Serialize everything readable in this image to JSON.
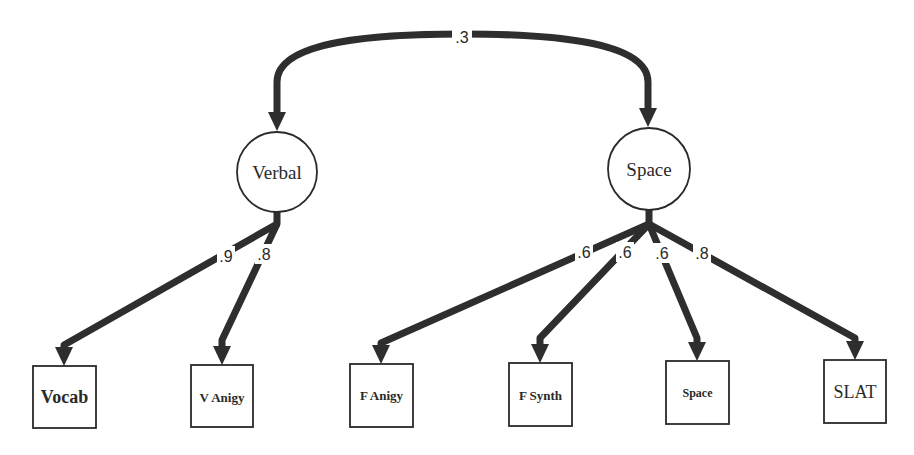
{
  "diagram": {
    "type": "structural-equation-model",
    "stroke_color": "#2e2e2e",
    "background": "#ffffff",
    "correlation": {
      "from": "Verbal",
      "to": "Space",
      "label": ".3",
      "label_pos": [
        462,
        36
      ]
    },
    "latents": [
      {
        "id": "verbal",
        "label": "Verbal",
        "cx": 277,
        "cy": 172,
        "r": 40
      },
      {
        "id": "space",
        "label": "Space",
        "cx": 649,
        "cy": 169,
        "r": 41
      }
    ],
    "observed": [
      {
        "id": "vocab",
        "label": "Vocab",
        "x": 33,
        "y": 366,
        "w": 63,
        "h": 62,
        "font_size": 18
      },
      {
        "id": "v-anigy",
        "label": "V Anigy",
        "x": 191,
        "y": 365,
        "w": 62,
        "h": 62,
        "font_size": 13
      },
      {
        "id": "f-anigy",
        "label": "F Anigy",
        "x": 350,
        "y": 364,
        "w": 63,
        "h": 63,
        "font_size": 13
      },
      {
        "id": "f-synth",
        "label": "F Synth",
        "x": 509,
        "y": 363,
        "w": 63,
        "h": 63,
        "font_size": 13
      },
      {
        "id": "space-test",
        "label": "Space",
        "x": 666,
        "y": 361,
        "w": 63,
        "h": 63,
        "font_size": 12
      },
      {
        "id": "slat",
        "label": "SLAT",
        "x": 824,
        "y": 360,
        "w": 62,
        "h": 63,
        "font_size": 18
      }
    ],
    "loadings": [
      {
        "from": "Verbal",
        "to": "Vocab",
        "label": ".9",
        "label_pos": [
          226,
          256
        ]
      },
      {
        "from": "Verbal",
        "to": "V Anigy",
        "label": ".8",
        "label_pos": [
          264,
          254
        ]
      },
      {
        "from": "Space",
        "to": "F Anigy",
        "label": ".6",
        "label_pos": [
          584,
          252
        ]
      },
      {
        "from": "Space",
        "to": "F Synth",
        "label": ".6",
        "label_pos": [
          625,
          252
        ]
      },
      {
        "from": "Space",
        "to": "Space",
        "label": ".6",
        "label_pos": [
          662,
          253
        ]
      },
      {
        "from": "Space",
        "to": "SLAT",
        "label": ".8",
        "label_pos": [
          702,
          253
        ]
      }
    ]
  }
}
